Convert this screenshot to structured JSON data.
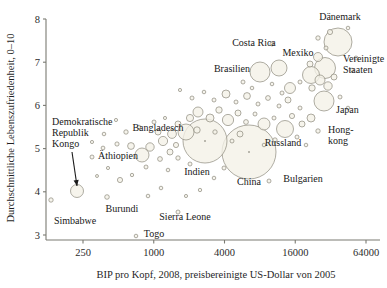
{
  "chart_data": {
    "type": "scatter",
    "title": "",
    "xlabel": "BIP pro Kopf, 2008, preisbereinigte US-Dollar von 2005",
    "ylabel": "Durchschnittliche Lebenszufriedenheit, 0–10",
    "xscale": "log",
    "xlim": [
      160,
      90000
    ],
    "ylim": [
      2.75,
      8.05
    ],
    "xticks": [
      250,
      1000,
      4000,
      16000,
      64000
    ],
    "xticklabels": [
      "250",
      "1000",
      "4000",
      "16000",
      "64000"
    ],
    "yticks": [
      3,
      4,
      5,
      6,
      7,
      8
    ],
    "yticklabels": [
      "3",
      "4",
      "5",
      "6",
      "7",
      "8"
    ],
    "grid": false,
    "legend": null,
    "marker_note": "Blasengroesse proportional zur Bevoelkerung",
    "annotations": [
      {
        "name": "kongo-arrow",
        "label": "Demokratische Republik Kongo",
        "from": [
          72,
          152
        ],
        "to": [
          77,
          186
        ]
      }
    ],
    "labels": [
      {
        "name": "label-daenemark",
        "text": "Dänemark",
        "x": 340,
        "y": 20,
        "anchor": "middle"
      },
      {
        "name": "label-costa-rica",
        "text": "Costa Rica",
        "x": 254,
        "y": 46,
        "anchor": "middle"
      },
      {
        "name": "label-mexiko",
        "text": "Mexiko",
        "x": 298,
        "y": 56,
        "anchor": "middle"
      },
      {
        "name": "label-vereinigte-staaten",
        "text": "Vereinigte",
        "x": 343,
        "y": 62,
        "anchor": "start"
      },
      {
        "name": "label-vereinigte-staaten2",
        "text": "Staaten",
        "x": 343,
        "y": 73,
        "anchor": "start"
      },
      {
        "name": "label-brasilien",
        "text": "Brasilien",
        "x": 232,
        "y": 72,
        "anchor": "middle"
      },
      {
        "name": "label-japan",
        "text": "Japan",
        "x": 336,
        "y": 113,
        "anchor": "start"
      },
      {
        "name": "label-hongkong",
        "text": "Hong-",
        "x": 328,
        "y": 133,
        "anchor": "start"
      },
      {
        "name": "label-hongkong2",
        "text": "kong",
        "x": 328,
        "y": 144,
        "anchor": "start"
      },
      {
        "name": "label-russland",
        "text": "Russland",
        "x": 283,
        "y": 146,
        "anchor": "middle"
      },
      {
        "name": "label-bangladesch",
        "text": "Bangladesch",
        "x": 158,
        "y": 131,
        "anchor": "middle"
      },
      {
        "name": "label-demokratische",
        "text": "Demokratische",
        "x": 52,
        "y": 125,
        "anchor": "start"
      },
      {
        "name": "label-republik",
        "text": "Republik",
        "x": 52,
        "y": 136,
        "anchor": "start"
      },
      {
        "name": "label-kongo",
        "text": "Kongo",
        "x": 52,
        "y": 147,
        "anchor": "start"
      },
      {
        "name": "label-aethiopien",
        "text": "Äthiopien",
        "x": 118,
        "y": 159,
        "anchor": "middle"
      },
      {
        "name": "label-indien",
        "text": "Indien",
        "x": 197,
        "y": 175,
        "anchor": "middle"
      },
      {
        "name": "label-china",
        "text": "China",
        "x": 249,
        "y": 185,
        "anchor": "middle"
      },
      {
        "name": "label-bulgarien",
        "text": "Bulgarien",
        "x": 303,
        "y": 182,
        "anchor": "middle"
      },
      {
        "name": "label-burundi",
        "text": "Burundi",
        "x": 122,
        "y": 212,
        "anchor": "middle"
      },
      {
        "name": "label-simbabwe",
        "text": "Simbabwe",
        "x": 75,
        "y": 224,
        "anchor": "middle"
      },
      {
        "name": "label-sierra-leone",
        "text": "Sierra Leone",
        "x": 185,
        "y": 220,
        "anchor": "middle"
      },
      {
        "name": "label-togo",
        "text": "Togo",
        "x": 154,
        "y": 237,
        "anchor": "middle"
      }
    ],
    "points": [
      {
        "name": "daenemark",
        "px": 338,
        "py": 42,
        "r": 14.0,
        "label": "Dänemark"
      },
      {
        "name": "vereinigte-staaten",
        "px": 325,
        "py": 68,
        "r": 10.5,
        "label": "Vereinigte Staaten"
      },
      {
        "name": "mexiko",
        "px": 311,
        "py": 75,
        "r": 8.5,
        "label": "Mexiko"
      },
      {
        "name": "japan",
        "px": 324,
        "py": 101,
        "r": 10.0,
        "label": "Japan"
      },
      {
        "name": "brasilien",
        "px": 260,
        "py": 72,
        "r": 10.0,
        "label": "Brasilien"
      },
      {
        "name": "brasilien-neighbor",
        "px": 279,
        "py": 68,
        "r": 8.0,
        "label": ""
      },
      {
        "name": "costa-rica",
        "px": 272,
        "py": 44,
        "r": 2.0,
        "label": "Costa Rica"
      },
      {
        "name": "russland",
        "px": 285,
        "py": 129,
        "r": 8.5,
        "label": "Russland"
      },
      {
        "name": "hongkong",
        "px": 318,
        "py": 131,
        "r": 2.2,
        "label": "Hong-kong"
      },
      {
        "name": "china",
        "px": 249,
        "py": 152,
        "r": 27.0,
        "label": "China"
      },
      {
        "name": "indien",
        "px": 205,
        "py": 141,
        "r": 22.0,
        "label": "Indien"
      },
      {
        "name": "bangladesch",
        "px": 186,
        "py": 132,
        "r": 8.0,
        "label": "Bangladesch"
      },
      {
        "name": "bulgarien",
        "px": 269,
        "py": 181,
        "r": 2.0,
        "label": "Bulgarien"
      },
      {
        "name": "dr-kongo",
        "px": 77,
        "py": 191,
        "r": 6.5,
        "label": "Demokratische Republik Kongo"
      },
      {
        "name": "aethiopien",
        "px": 142,
        "py": 155,
        "r": 7.0,
        "label": "Äthiopien"
      },
      {
        "name": "burundi",
        "px": 107,
        "py": 197,
        "r": 2.3,
        "label": "Burundi"
      },
      {
        "name": "simbabwe",
        "px": 51,
        "py": 200,
        "r": 2.2,
        "label": "Simbabwe"
      },
      {
        "name": "sierra-leone",
        "px": 178,
        "py": 212,
        "r": 2.0,
        "label": "Sierra Leone"
      },
      {
        "name": "togo",
        "px": 136,
        "py": 236,
        "r": 1.8,
        "label": "Togo"
      },
      {
        "name": "p01",
        "px": 103,
        "py": 148,
        "r": 1.9,
        "label": ""
      },
      {
        "name": "p02",
        "px": 117,
        "py": 144,
        "r": 2.1,
        "label": ""
      },
      {
        "name": "p03",
        "px": 131,
        "py": 146,
        "r": 3.4,
        "label": ""
      },
      {
        "name": "p04",
        "px": 150,
        "py": 147,
        "r": 4.2,
        "label": ""
      },
      {
        "name": "p05",
        "px": 163,
        "py": 141,
        "r": 4.6,
        "label": ""
      },
      {
        "name": "p06",
        "px": 170,
        "py": 152,
        "r": 3.0,
        "label": ""
      },
      {
        "name": "p07",
        "px": 176,
        "py": 145,
        "r": 2.6,
        "label": ""
      },
      {
        "name": "p08",
        "px": 160,
        "py": 159,
        "r": 2.4,
        "label": ""
      },
      {
        "name": "p09",
        "px": 146,
        "py": 167,
        "r": 2.0,
        "label": ""
      },
      {
        "name": "p10",
        "px": 132,
        "py": 175,
        "r": 1.7,
        "label": ""
      },
      {
        "name": "p11",
        "px": 120,
        "py": 180,
        "r": 2.6,
        "label": ""
      },
      {
        "name": "p12",
        "px": 108,
        "py": 168,
        "r": 1.6,
        "label": ""
      },
      {
        "name": "p13",
        "px": 97,
        "py": 176,
        "r": 1.5,
        "label": ""
      },
      {
        "name": "p14",
        "px": 92,
        "py": 157,
        "r": 2.0,
        "label": ""
      },
      {
        "name": "p15",
        "px": 126,
        "py": 132,
        "r": 2.2,
        "label": ""
      },
      {
        "name": "p16",
        "px": 139,
        "py": 127,
        "r": 1.8,
        "label": ""
      },
      {
        "name": "p17",
        "px": 154,
        "py": 122,
        "r": 2.0,
        "label": ""
      },
      {
        "name": "p18",
        "px": 165,
        "py": 118,
        "r": 1.6,
        "label": ""
      },
      {
        "name": "p19",
        "px": 178,
        "py": 124,
        "r": 3.0,
        "label": ""
      },
      {
        "name": "p20",
        "px": 190,
        "py": 118,
        "r": 3.6,
        "label": ""
      },
      {
        "name": "p21",
        "px": 198,
        "py": 112,
        "r": 5.0,
        "label": ""
      },
      {
        "name": "p22",
        "px": 210,
        "py": 118,
        "r": 4.0,
        "label": ""
      },
      {
        "name": "p23",
        "px": 219,
        "py": 110,
        "r": 3.2,
        "label": ""
      },
      {
        "name": "p24",
        "px": 228,
        "py": 120,
        "r": 5.6,
        "label": ""
      },
      {
        "name": "p25",
        "px": 238,
        "py": 113,
        "r": 3.0,
        "label": ""
      },
      {
        "name": "p26",
        "px": 246,
        "py": 122,
        "r": 2.4,
        "label": ""
      },
      {
        "name": "p27",
        "px": 255,
        "py": 114,
        "r": 2.0,
        "label": ""
      },
      {
        "name": "p28",
        "px": 264,
        "py": 124,
        "r": 6.0,
        "label": ""
      },
      {
        "name": "p29",
        "px": 274,
        "py": 118,
        "r": 2.0,
        "label": ""
      },
      {
        "name": "p30",
        "px": 292,
        "py": 116,
        "r": 2.6,
        "label": ""
      },
      {
        "name": "p31",
        "px": 302,
        "py": 124,
        "r": 3.0,
        "label": ""
      },
      {
        "name": "p32",
        "px": 311,
        "py": 118,
        "r": 4.0,
        "label": ""
      },
      {
        "name": "p33",
        "px": 300,
        "py": 108,
        "r": 2.0,
        "label": ""
      },
      {
        "name": "p34",
        "px": 288,
        "py": 100,
        "r": 3.0,
        "label": ""
      },
      {
        "name": "p35",
        "px": 279,
        "py": 106,
        "r": 2.0,
        "label": ""
      },
      {
        "name": "p36",
        "px": 268,
        "py": 98,
        "r": 2.4,
        "label": ""
      },
      {
        "name": "p37",
        "px": 258,
        "py": 104,
        "r": 2.0,
        "label": ""
      },
      {
        "name": "p38",
        "px": 247,
        "py": 96,
        "r": 3.4,
        "label": ""
      },
      {
        "name": "p39",
        "px": 236,
        "py": 102,
        "r": 2.0,
        "label": ""
      },
      {
        "name": "p40",
        "px": 226,
        "py": 94,
        "r": 4.0,
        "label": ""
      },
      {
        "name": "p41",
        "px": 214,
        "py": 100,
        "r": 2.0,
        "label": ""
      },
      {
        "name": "p42",
        "px": 204,
        "py": 92,
        "r": 1.8,
        "label": ""
      },
      {
        "name": "p43",
        "px": 192,
        "py": 98,
        "r": 2.0,
        "label": ""
      },
      {
        "name": "p44",
        "px": 180,
        "py": 90,
        "r": 1.6,
        "label": ""
      },
      {
        "name": "p45",
        "px": 243,
        "py": 82,
        "r": 2.0,
        "label": ""
      },
      {
        "name": "p46",
        "px": 252,
        "py": 88,
        "r": 1.8,
        "label": ""
      },
      {
        "name": "p47",
        "px": 290,
        "py": 88,
        "r": 5.5,
        "label": ""
      },
      {
        "name": "p48",
        "px": 300,
        "py": 82,
        "r": 2.0,
        "label": ""
      },
      {
        "name": "p49",
        "px": 312,
        "py": 88,
        "r": 3.2,
        "label": ""
      },
      {
        "name": "p50",
        "px": 320,
        "py": 80,
        "r": 5.0,
        "label": ""
      },
      {
        "name": "p51",
        "px": 328,
        "py": 86,
        "r": 4.2,
        "label": ""
      },
      {
        "name": "p52",
        "px": 334,
        "py": 77,
        "r": 3.0,
        "label": ""
      },
      {
        "name": "p53",
        "px": 318,
        "py": 57,
        "r": 4.5,
        "label": ""
      },
      {
        "name": "p54",
        "px": 310,
        "py": 64,
        "r": 3.0,
        "label": ""
      },
      {
        "name": "p55",
        "px": 326,
        "py": 48,
        "r": 2.0,
        "label": ""
      },
      {
        "name": "p56",
        "px": 318,
        "py": 38,
        "r": 2.2,
        "label": ""
      },
      {
        "name": "p57",
        "px": 330,
        "py": 32,
        "r": 2.6,
        "label": ""
      },
      {
        "name": "p58",
        "px": 348,
        "py": 28,
        "r": 1.8,
        "label": ""
      },
      {
        "name": "p59",
        "px": 356,
        "py": 58,
        "r": 2.0,
        "label": ""
      },
      {
        "name": "p60",
        "px": 352,
        "py": 70,
        "r": 1.8,
        "label": ""
      },
      {
        "name": "p61",
        "px": 340,
        "py": 97,
        "r": 2.0,
        "label": ""
      },
      {
        "name": "p62",
        "px": 348,
        "py": 108,
        "r": 1.8,
        "label": ""
      },
      {
        "name": "p63",
        "px": 297,
        "py": 137,
        "r": 2.0,
        "label": ""
      },
      {
        "name": "p64",
        "px": 306,
        "py": 145,
        "r": 1.8,
        "label": ""
      },
      {
        "name": "p65",
        "px": 275,
        "py": 140,
        "r": 2.2,
        "label": ""
      },
      {
        "name": "p66",
        "px": 264,
        "py": 145,
        "r": 1.8,
        "label": ""
      },
      {
        "name": "p67",
        "px": 224,
        "py": 168,
        "r": 2.0,
        "label": ""
      },
      {
        "name": "p68",
        "px": 214,
        "py": 178,
        "r": 1.8,
        "label": ""
      },
      {
        "name": "p69",
        "px": 190,
        "py": 164,
        "r": 2.0,
        "label": ""
      },
      {
        "name": "p70",
        "px": 178,
        "py": 158,
        "r": 2.2,
        "label": ""
      },
      {
        "name": "p71",
        "px": 168,
        "py": 170,
        "r": 1.8,
        "label": ""
      },
      {
        "name": "p72",
        "px": 200,
        "py": 190,
        "r": 1.7,
        "label": ""
      },
      {
        "name": "p73",
        "px": 186,
        "py": 196,
        "r": 1.6,
        "label": ""
      },
      {
        "name": "p74",
        "px": 161,
        "py": 188,
        "r": 1.8,
        "label": ""
      },
      {
        "name": "p75",
        "px": 148,
        "py": 196,
        "r": 1.8,
        "label": ""
      },
      {
        "name": "p76",
        "px": 116,
        "py": 120,
        "r": 1.6,
        "label": ""
      },
      {
        "name": "p77",
        "px": 104,
        "py": 134,
        "r": 1.8,
        "label": ""
      },
      {
        "name": "p78",
        "px": 92,
        "py": 142,
        "r": 1.6,
        "label": ""
      },
      {
        "name": "p79",
        "px": 240,
        "py": 134,
        "r": 3.0,
        "label": ""
      },
      {
        "name": "p80",
        "px": 232,
        "py": 141,
        "r": 2.0,
        "label": ""
      },
      {
        "name": "p81",
        "px": 172,
        "py": 134,
        "r": 4.4,
        "label": ""
      },
      {
        "name": "p82",
        "px": 158,
        "py": 132,
        "r": 3.0,
        "label": ""
      },
      {
        "name": "p83",
        "px": 197,
        "py": 130,
        "r": 3.2,
        "label": ""
      },
      {
        "name": "p84",
        "px": 215,
        "py": 132,
        "r": 2.2,
        "label": ""
      },
      {
        "name": "p85",
        "px": 282,
        "py": 93,
        "r": 2.0,
        "label": ""
      },
      {
        "name": "p86",
        "px": 272,
        "py": 84,
        "r": 1.8,
        "label": ""
      }
    ]
  },
  "axes": {
    "y_title": "Durchschnittliche Lebenszufriedenheit, 0–10",
    "x_title": "BIP pro Kopf, 2008, preisbereinigte US-Dollar von 2005"
  }
}
